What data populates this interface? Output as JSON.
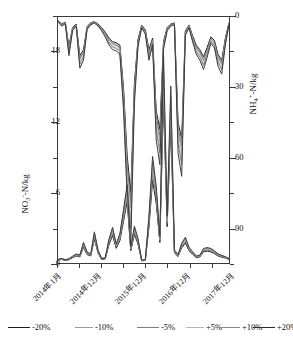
{
  "chart_data": {
    "type": "line",
    "title": "",
    "xlabel": "",
    "x_tick_labels": [
      "2014年1月",
      "2014年12月",
      "2015年12月",
      "2016年12月",
      "2017年12月"
    ],
    "x_tick_index": [
      0,
      11,
      23,
      35,
      47
    ],
    "x_range": [
      0,
      47
    ],
    "n_points": 48,
    "axes": [
      {
        "id": "left",
        "label": "NO₃⁻-N/kg",
        "label_base": "NO",
        "label_sub": "3",
        "label_sup": "-",
        "label_tail": "-N/kg",
        "ticks": [
          0,
          6,
          12,
          18
        ],
        "range": [
          0,
          21
        ],
        "inverted": false,
        "position": "left"
      },
      {
        "id": "right",
        "label": "NH₄⁺-N/kg",
        "label_base": "NH",
        "label_sub": "4",
        "label_sup": "+",
        "label_tail": "-N/kg",
        "ticks": [
          0,
          30,
          60,
          90
        ],
        "range": [
          0,
          105
        ],
        "inverted": true,
        "position": "right"
      }
    ],
    "grid": false,
    "legend_position": "bottom",
    "series": [
      {
        "name": "-20%",
        "color": "#1c1c1c",
        "width": 1.0,
        "axis": "left",
        "values": [
          0.25,
          0.3,
          0.22,
          0.28,
          0.45,
          0.6,
          0.52,
          1.35,
          0.72,
          0.6,
          2.05,
          0.85,
          0.3,
          0.35,
          1.55,
          2.35,
          1.25,
          1.9,
          3.55,
          5.25,
          1.05,
          2.45,
          1.6,
          0.18,
          0.22,
          3.05,
          7.05,
          5.1,
          1.75,
          13.9,
          3.1,
          11.9,
          0.85,
          0.55,
          1.3,
          1.7,
          1.05,
          0.75,
          0.45,
          0.52,
          0.95,
          1.02,
          0.95,
          0.8,
          0.6,
          0.5,
          0.42,
          0.3
        ]
      },
      {
        "name": "-10%",
        "color": "#5e5e5e",
        "width": 0.9,
        "axis": "left",
        "values": [
          0.26,
          0.32,
          0.24,
          0.3,
          0.48,
          0.64,
          0.56,
          1.45,
          0.78,
          0.64,
          2.2,
          0.92,
          0.33,
          0.38,
          1.68,
          2.52,
          1.35,
          2.05,
          3.8,
          5.55,
          1.14,
          2.62,
          1.72,
          0.2,
          0.24,
          3.3,
          7.55,
          5.45,
          1.88,
          14.8,
          3.32,
          12.6,
          0.92,
          0.6,
          1.4,
          1.82,
          1.12,
          0.8,
          0.49,
          0.56,
          1.02,
          1.09,
          1.02,
          0.86,
          0.65,
          0.54,
          0.45,
          0.32
        ]
      },
      {
        "name": "-5%",
        "color": "#8f8f8f",
        "width": 0.8,
        "axis": "left",
        "values": [
          0.27,
          0.33,
          0.25,
          0.31,
          0.5,
          0.66,
          0.58,
          1.5,
          0.81,
          0.66,
          2.28,
          0.95,
          0.34,
          0.4,
          1.74,
          2.6,
          1.4,
          2.12,
          3.92,
          5.72,
          1.18,
          2.7,
          1.78,
          0.21,
          0.25,
          3.42,
          7.8,
          5.62,
          1.94,
          15.3,
          3.43,
          13.0,
          0.95,
          0.62,
          1.45,
          1.88,
          1.16,
          0.83,
          0.51,
          0.58,
          1.06,
          1.13,
          1.06,
          0.89,
          0.67,
          0.56,
          0.46,
          0.33
        ]
      },
      {
        "name": "+5%",
        "color": "#a8a8a8",
        "width": 0.8,
        "axis": "left",
        "values": [
          0.29,
          0.35,
          0.27,
          0.33,
          0.53,
          0.7,
          0.62,
          1.6,
          0.86,
          0.7,
          2.42,
          1.01,
          0.36,
          0.42,
          1.85,
          2.77,
          1.49,
          2.25,
          4.16,
          6.08,
          1.26,
          2.87,
          1.89,
          0.22,
          0.27,
          3.64,
          8.3,
          5.98,
          2.06,
          16.3,
          3.65,
          13.8,
          1.01,
          0.66,
          1.54,
          2.0,
          1.23,
          0.88,
          0.54,
          0.62,
          1.13,
          1.2,
          1.13,
          0.95,
          0.71,
          0.59,
          0.49,
          0.35
        ]
      },
      {
        "name": "+10%",
        "color": "#777777",
        "width": 0.9,
        "axis": "left",
        "values": [
          0.3,
          0.36,
          0.28,
          0.34,
          0.55,
          0.73,
          0.64,
          1.66,
          0.89,
          0.73,
          2.52,
          1.05,
          0.37,
          0.44,
          1.92,
          2.88,
          1.55,
          2.34,
          4.32,
          6.32,
          1.31,
          2.98,
          1.97,
          0.23,
          0.28,
          3.78,
          8.62,
          6.22,
          2.14,
          16.9,
          3.79,
          14.3,
          1.05,
          0.68,
          1.6,
          2.08,
          1.28,
          0.92,
          0.56,
          0.64,
          1.17,
          1.25,
          1.17,
          0.98,
          0.74,
          0.62,
          0.51,
          0.37
        ]
      },
      {
        "name": "+20%",
        "color": "#3d3d3d",
        "width": 1.0,
        "axis": "left",
        "values": [
          0.32,
          0.38,
          0.29,
          0.36,
          0.58,
          0.77,
          0.68,
          1.76,
          0.94,
          0.77,
          2.66,
          1.11,
          0.39,
          0.46,
          2.03,
          3.05,
          1.64,
          2.47,
          4.57,
          6.68,
          1.38,
          3.15,
          2.08,
          0.24,
          0.3,
          4.0,
          9.1,
          6.58,
          2.26,
          17.9,
          4.01,
          15.1,
          1.11,
          0.72,
          1.69,
          2.2,
          1.35,
          0.97,
          0.59,
          0.68,
          1.24,
          1.32,
          1.24,
          1.04,
          0.78,
          0.65,
          0.54,
          0.39
        ]
      }
    ],
    "series_right": [
      {
        "name": "-20%",
        "color": "#1c1c1c",
        "width": 1.0,
        "axis": "right",
        "values": [
          1.5,
          3.0,
          2.2,
          12.5,
          4.5,
          3.0,
          16.5,
          14.0,
          4.0,
          2.5,
          2.0,
          3.0,
          4.5,
          6.5,
          9.0,
          10.5,
          11.0,
          12.0,
          30.0,
          59.0,
          75.0,
          28.0,
          9.5,
          3.5,
          5.5,
          14.0,
          9.0,
          40.0,
          48.0,
          10.5,
          4.5,
          3.0,
          2.5,
          45.0,
          52.0,
          6.0,
          3.5,
          8.0,
          12.0,
          14.0,
          17.0,
          13.0,
          8.5,
          10.0,
          16.0,
          18.5,
          9.0,
          2.5
        ]
      },
      {
        "name": "-10%",
        "color": "#5e5e5e",
        "width": 0.9,
        "axis": "right",
        "values": [
          1.6,
          3.2,
          2.4,
          13.4,
          4.8,
          3.2,
          17.6,
          15.0,
          4.3,
          2.7,
          2.1,
          3.2,
          4.8,
          6.9,
          9.6,
          11.2,
          11.8,
          12.8,
          32.0,
          62.5,
          79.0,
          30.0,
          10.2,
          3.7,
          5.9,
          15.0,
          9.6,
          42.5,
          51.0,
          11.2,
          4.8,
          3.2,
          2.7,
          47.5,
          55.0,
          6.4,
          3.7,
          8.5,
          12.8,
          15.0,
          18.1,
          13.9,
          9.1,
          10.7,
          17.1,
          19.7,
          9.6,
          2.7
        ]
      },
      {
        "name": "-5%",
        "color": "#8f8f8f",
        "width": 0.8,
        "axis": "right",
        "values": [
          1.7,
          3.3,
          2.5,
          13.9,
          5.0,
          3.3,
          18.2,
          15.5,
          4.4,
          2.8,
          2.2,
          3.3,
          5.0,
          7.2,
          10.0,
          11.6,
          12.2,
          13.3,
          33.0,
          64.5,
          81.5,
          31.0,
          10.5,
          3.9,
          6.1,
          15.5,
          10.0,
          44.0,
          53.0,
          11.6,
          5.0,
          3.3,
          2.8,
          49.0,
          57.0,
          6.6,
          3.9,
          8.8,
          13.3,
          15.5,
          18.8,
          14.4,
          9.4,
          11.1,
          17.7,
          20.4,
          10.0,
          2.8
        ]
      },
      {
        "name": "+5%",
        "color": "#a8a8a8",
        "width": 0.8,
        "axis": "right",
        "values": [
          1.8,
          3.5,
          2.6,
          14.8,
          5.3,
          3.5,
          19.4,
          16.5,
          4.7,
          3.0,
          2.3,
          3.5,
          5.3,
          7.6,
          10.6,
          12.3,
          13.0,
          14.1,
          35.0,
          68.5,
          87.0,
          33.0,
          11.2,
          4.1,
          6.5,
          16.5,
          10.6,
          46.5,
          56.0,
          12.3,
          5.3,
          3.5,
          3.0,
          52.0,
          60.5,
          7.0,
          4.1,
          9.4,
          14.1,
          16.5,
          20.0,
          15.3,
          10.0,
          11.8,
          18.8,
          21.7,
          10.6,
          3.0
        ]
      },
      {
        "name": "+10%",
        "color": "#777777",
        "width": 0.9,
        "axis": "right",
        "values": [
          1.9,
          3.6,
          2.7,
          15.4,
          5.5,
          3.6,
          20.2,
          17.2,
          4.9,
          3.1,
          2.4,
          3.6,
          5.5,
          7.9,
          11.0,
          12.8,
          13.5,
          14.7,
          36.5,
          71.0,
          90.5,
          34.0,
          11.6,
          4.3,
          6.8,
          17.2,
          11.0,
          48.5,
          58.0,
          12.8,
          5.5,
          3.6,
          3.1,
          54.0,
          63.0,
          7.3,
          4.3,
          9.8,
          14.7,
          17.2,
          20.8,
          15.9,
          10.4,
          12.3,
          19.6,
          22.6,
          11.0,
          3.1
        ]
      },
      {
        "name": "+20%",
        "color": "#3d3d3d",
        "width": 1.0,
        "axis": "right",
        "values": [
          2.0,
          3.9,
          2.9,
          16.5,
          5.9,
          3.9,
          21.8,
          18.5,
          5.3,
          3.3,
          2.6,
          3.9,
          5.9,
          8.6,
          11.9,
          13.9,
          14.5,
          15.8,
          39.5,
          76.5,
          97.0,
          37.0,
          12.5,
          4.6,
          7.3,
          18.5,
          11.9,
          52.5,
          63.0,
          13.9,
          5.9,
          3.9,
          3.3,
          58.0,
          68.0,
          7.9,
          4.6,
          10.6,
          15.8,
          18.5,
          22.4,
          17.2,
          11.2,
          13.2,
          21.1,
          24.4,
          11.9,
          3.3
        ]
      }
    ]
  },
  "legend": {
    "items": [
      {
        "label": "-20%",
        "color": "#1c1c1c",
        "width": 1.3
      },
      {
        "label": "-10%",
        "color": "#9a9a9a",
        "width": 0.9
      },
      {
        "label": "-5%",
        "color": "#7d7d7d",
        "width": 1.0
      },
      {
        "label": "+5%",
        "color": "#b5b5b5",
        "width": 0.8
      },
      {
        "label": "+10%",
        "color": "#8a8a8a",
        "width": 1.0
      },
      {
        "label": "+20%",
        "color": "#2b2b2b",
        "width": 1.4
      }
    ]
  }
}
